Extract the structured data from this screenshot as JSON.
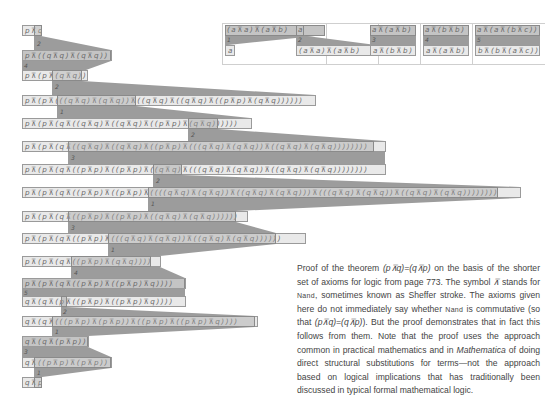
{
  "axioms": [
    {
      "top": "(a⊼a)⊼(a⊼b)",
      "step": "1",
      "bottom": "a"
    },
    {
      "top": "a",
      "step": "2",
      "bottom": "(a⊼a)⊼(a⊼b)"
    },
    {
      "top": "a⊼(a⊼b)",
      "step": "3",
      "bottom": "a⊼(b⊼b)"
    },
    {
      "top": "a⊼(b⊼b)",
      "step": "4",
      "bottom": "a⊼(a⊼b)"
    },
    {
      "top": "a⊼(a⊼(b⊼c))",
      "step": "5",
      "bottom": "b⊼(b⊼(a⊼c))"
    }
  ],
  "proof_lines": [
    "p⊼q",
    "p⊼((q⊼q)⊼(q⊼q))",
    "p⊼(p⊼(q⊼q))",
    "p⊼(p⊼(((q⊼q)⊼(q⊼q))⊼((q⊼q)⊼((q⊼q)⊼((p⊼p)⊼(q⊼q))))))",
    "p⊼(p⊼(q⊼((q⊼q)⊼((q⊼q)⊼((p⊼p)⊼(q⊼q))))))",
    "p⊼(p⊼(q⊼((q⊼q)⊼((q⊼q)⊼((p⊼p)⊼(((q⊼q)⊼(q⊼q))⊼((q⊼q)⊼(q⊼q))))))))",
    "p⊼(p⊼(q⊼((p⊼p)⊼((p⊼p)⊼((q⊼q)⊼(((q⊼q)⊼(q⊼q))⊼((q⊼q)⊼(q⊼q))))))))",
    "p⊼(p⊼(q⊼((p⊼p)⊼((p⊼p)⊼((((q⊼q)⊼(q⊼q))⊼((q⊼q)⊼(q⊼q)))⊼(((q⊼q)⊼(q⊼q))⊼((q⊼q)⊼(q⊼q))))))))",
    "p⊼(p⊼(q⊼((p⊼p)⊼((p⊼p)⊼((q⊼q)⊼(q⊼q))))))",
    "p⊼(p⊼(q⊼((p⊼p)⊼(((q⊼q)⊼(q⊼q))⊼((q⊼q)⊼(q⊼q))))))",
    "p⊼(p⊼(q⊼((p⊼p)⊼(q⊼q))))",
    "p⊼(p⊼(q⊼((p⊼p)⊼((p⊼p)⊼q))))",
    "q⊼(q⊼(p⊼((p⊼p)⊼((p⊼p)⊼q))))",
    "q⊼(q⊼(((p⊼p)⊼(p⊼p))⊼((p⊼p)⊼((p⊼p)⊼q))))",
    "q⊼(q⊼(p⊼p))",
    "q⊼((p⊼p)⊼(p⊼p))",
    "q⊼p"
  ],
  "steps": [
    "2",
    "4",
    "2",
    "1",
    "2",
    "3",
    "2",
    "1",
    "3",
    "1",
    "4",
    "5",
    "2",
    "1",
    "3",
    "1"
  ],
  "caption": {
    "p1": "Proof of the theorem ",
    "thm": "(p⊼q)=(q⊼p)",
    "p2": " on the basis of the shorter set of axioms for logic from page 773. The symbol ",
    "sym": "⊼",
    "p3": " stands for ",
    "nand1": "Nand",
    "p4": ", sometimes known as Sheffer stroke. The axioms given here do not immediately say whether ",
    "nand2": "Nand",
    "p5": " is commutative (so that ",
    "thm2": "(p⊼q)=(q⊼p)",
    "p6": "). But the proof demonstrates that in fact this follows from them. Note that the proof uses the approach common in practical mathematics and in ",
    "mathematica": "Mathematica",
    "p7": " of doing direct structural substitutions for terms—not the approach based on logical implications that has traditionally been discussed in typical formal mathematical logic."
  },
  "colors": {
    "band": "#9c9c9c",
    "row": "#e9e9e9",
    "highlight": "#c4c4c4",
    "border": "#9a9a9a"
  }
}
